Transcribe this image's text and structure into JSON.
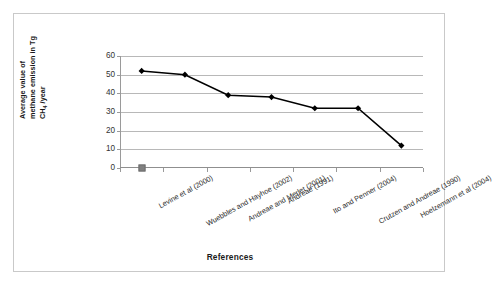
{
  "chart_data": {
    "type": "line",
    "title": "",
    "xlabel": "References",
    "ylabel_lines": [
      "Average value of",
      "methane emission in Tg",
      "CH4 /year"
    ],
    "ylabel": "Average value of methane emission in Tg CH4 /year",
    "categories": [
      "Levine et al (2000)",
      "Wuebbles and Hayhoe (2002)",
      "Andreae and Merlet (2001)",
      "Andreae (1991)",
      "Ito and Penner (2004)",
      "Crutzen and Andreae (1990)",
      "Hoelzemann et al (2004)"
    ],
    "series": [
      {
        "name": "Average methane emission",
        "marker": "diamond",
        "color": "#000000",
        "values": [
          52,
          50,
          39,
          38,
          32,
          32,
          12
        ]
      },
      {
        "name": "Reference marker",
        "marker": "square",
        "color": "#808080",
        "values": [
          0,
          null,
          null,
          null,
          null,
          null,
          null
        ]
      }
    ],
    "yticks": [
      0,
      10,
      20,
      30,
      40,
      50,
      60
    ],
    "ylim": [
      0,
      60
    ],
    "grid": "horizontal",
    "legend": "none"
  },
  "colors": {
    "line": "#000000",
    "marker_square": "#808080",
    "gridline": "#b8b8b8",
    "axis": "#9a9a9a",
    "frame": "#c9c9c9",
    "text": "#1a1a1a"
  }
}
